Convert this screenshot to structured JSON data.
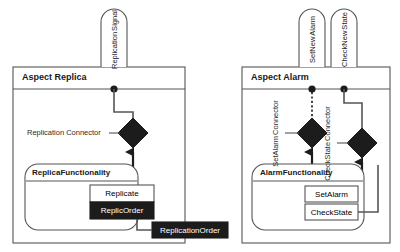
{
  "diagram": {
    "type": "uml-aspect-composition",
    "background": "#ffffff",
    "stroke_color": "#555555",
    "fill_black": "#1c1c1c",
    "fill_white": "#ffffff",
    "panels": [
      {
        "id": "replica",
        "title": "Aspect Replica",
        "signals": [
          {
            "id": "replication-signal",
            "label_line1": "Replication",
            "label_line2": "Signal"
          }
        ],
        "connectors": [
          {
            "id": "replication-connector",
            "label": "Replication Connector",
            "shape": "diamond",
            "filled": true
          }
        ],
        "functionality": {
          "id": "replica-functionality",
          "title": "ReplicaFunctionality",
          "operations": [
            {
              "id": "replicate",
              "label": "Replicate",
              "style": "white"
            },
            {
              "id": "replic-order",
              "label": "ReplicOrder",
              "style": "black"
            }
          ]
        },
        "external": [
          {
            "id": "replication-order",
            "label": "ReplicationOrder",
            "style": "black"
          }
        ]
      },
      {
        "id": "alarm",
        "title": "Aspect Alarm",
        "signals": [
          {
            "id": "setnew-alarm",
            "label_line1": "SetNew",
            "label_line2": "Alarm"
          },
          {
            "id": "checknew-state",
            "label_line1": "CheckNew",
            "label_line2": "State"
          }
        ],
        "connectors": [
          {
            "id": "setalarm-connector",
            "label_line1": "SetAlarm",
            "label_line2": "Connector",
            "shape": "diamond",
            "filled": true
          },
          {
            "id": "checkstate-connector",
            "label_line1": "CheckState",
            "label_line2": "Connector",
            "shape": "diamond",
            "filled": true
          }
        ],
        "functionality": {
          "id": "alarm-functionality",
          "title": "AlarmFunctionality",
          "operations": [
            {
              "id": "setalarm",
              "label": "SetAlarm",
              "style": "white"
            },
            {
              "id": "checkstate",
              "label": "CheckState",
              "style": "white"
            }
          ]
        },
        "external": []
      }
    ]
  }
}
